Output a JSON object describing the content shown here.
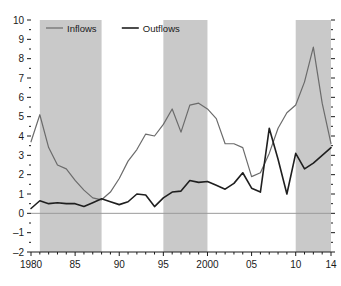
{
  "chart_data": {
    "type": "line",
    "title": "",
    "subtitle": "",
    "xlabel": "",
    "ylabel": "",
    "xlim": [
      1980,
      2014
    ],
    "ylim": [
      -2,
      10
    ],
    "grid": false,
    "legend_position": "top-left",
    "zero_line": true,
    "x": [
      1980,
      1981,
      1982,
      1983,
      1984,
      1985,
      1986,
      1987,
      1988,
      1989,
      1990,
      1991,
      1992,
      1993,
      1994,
      1995,
      1996,
      1997,
      1998,
      1999,
      2000,
      2001,
      2002,
      2003,
      2004,
      2005,
      2006,
      2007,
      2008,
      2009,
      2010,
      2011,
      2012,
      2013,
      2014
    ],
    "series": [
      {
        "name": "Inflows",
        "color": "#6b6b6b",
        "values": [
          3.7,
          5.1,
          3.4,
          2.5,
          2.3,
          1.7,
          1.2,
          0.8,
          0.7,
          1.1,
          1.8,
          2.7,
          3.3,
          4.1,
          4.0,
          4.6,
          5.4,
          4.2,
          5.6,
          5.7,
          5.4,
          4.9,
          3.6,
          3.6,
          3.4,
          1.9,
          2.1,
          3.1,
          4.4,
          5.2,
          5.6,
          6.8,
          8.6,
          5.7,
          3.6
        ]
      },
      {
        "name": "Outflows",
        "color": "#1f1f1f",
        "values": [
          0.25,
          0.65,
          0.5,
          0.55,
          0.5,
          0.5,
          0.35,
          0.55,
          0.75,
          0.6,
          0.45,
          0.6,
          1.0,
          0.95,
          0.35,
          0.8,
          1.1,
          1.15,
          1.7,
          1.6,
          1.65,
          1.45,
          1.25,
          1.55,
          2.1,
          1.3,
          1.1,
          1.0,
          0.85,
          0.5,
          1.4,
          1.9,
          2.4,
          2.4,
          3.0
        ]
      }
    ],
    "series_note_values_outflows_tail": [
      4.4,
      2.8,
      1.0,
      3.1,
      2.3,
      2.6,
      3.0,
      3.4
    ],
    "yticks_major": [
      -2,
      -1,
      0,
      1,
      2,
      3,
      4,
      5,
      6,
      7,
      8,
      9,
      10
    ],
    "yticklabels": [
      "–2",
      "–1",
      "0",
      "1",
      "2",
      "3",
      "4",
      "5",
      "6",
      "7",
      "8",
      "9",
      "10"
    ],
    "xticks_major": [
      1980,
      1985,
      1990,
      1995,
      2000,
      2005,
      2010,
      2014
    ],
    "xticklabels": [
      "1980",
      "85",
      "90",
      "95",
      "2000",
      "05",
      "10",
      "14"
    ],
    "shaded_bands": [
      {
        "start": 1981,
        "end": 1988
      },
      {
        "start": 1995,
        "end": 2000
      },
      {
        "start": 2010,
        "end": 2014
      }
    ],
    "band_color": "#c9c9c9"
  },
  "legend": {
    "entries": [
      {
        "label": "Inflows",
        "color": "#6b6b6b"
      },
      {
        "label": "Outflows",
        "color": "#1f1f1f"
      }
    ]
  },
  "colors": {
    "inflows": "#6b6b6b",
    "outflows": "#1f1f1f",
    "band": "#c9c9c9",
    "axis": "#1a1a1a",
    "zero_line": "#9a9a9a",
    "background": "#ffffff"
  }
}
